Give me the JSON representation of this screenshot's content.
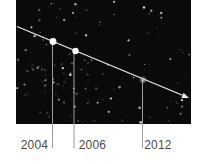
{
  "figure": {
    "type": "annotated-astronomy-photo",
    "background_color": "#ffffff",
    "panel": {
      "x": 16,
      "y": 0,
      "width": 175,
      "height": 124,
      "color": "#0a0a0a"
    },
    "trajectory": {
      "line_color": "#efefef",
      "start": {
        "x": 17,
        "y": 26.5
      },
      "arrow_tip": {
        "x": 189,
        "y": 98
      },
      "arrow_length": 7,
      "arrow_half_width": 2.8
    },
    "callout_color": "#9c9c9c",
    "callout_bottom_y": 148,
    "label_color": "#4a4a4a",
    "points": [
      {
        "label": "2004",
        "x": 53,
        "y": 41.5,
        "style": "bright",
        "dot_color": "#ffffff",
        "radius": 3.4,
        "callout_x": 52.5,
        "label_center_x": 34.5
      },
      {
        "label": "2006",
        "x": 75.5,
        "y": 51,
        "style": "bright",
        "dot_color": "#ffffff",
        "radius": 3.2,
        "callout_x": 74,
        "label_center_x": 92.5
      },
      {
        "label": "2012",
        "x": 143,
        "y": 80,
        "style": "faint",
        "dot_color": "#c6c6c6",
        "radius": 2.4,
        "callout_x": 142.5,
        "label_center_x": 158
      }
    ],
    "noise": {
      "seed": 7,
      "trials": 260,
      "color": "#ffffff"
    }
  }
}
